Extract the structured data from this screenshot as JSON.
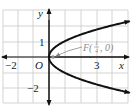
{
  "figure": {
    "equation": "y^2 = x",
    "origin_px": [
      49,
      57
    ],
    "unit_px": 15.8,
    "grid": {
      "color": "#c8c8c8",
      "x_lines_px": [
        3,
        18,
        33,
        49,
        65,
        81,
        97,
        112,
        128
      ],
      "y_lines_px": [
        10,
        26,
        42,
        57,
        73,
        88,
        103
      ]
    },
    "axes": {
      "x_label": "x",
      "y_label": "y",
      "origin_label": "O",
      "x_ticks": [
        {
          "value": -2,
          "label": "−2"
        },
        {
          "value": 3,
          "label": "3"
        }
      ],
      "y_ticks": [
        {
          "value": 1,
          "label": "1"
        },
        {
          "value": -2,
          "label": "−2"
        }
      ]
    },
    "curve": {
      "name": "parabola",
      "color": "#111111",
      "x_range": [
        0,
        5.1
      ]
    },
    "focus": {
      "label_prefix": "F(",
      "label_num": "1",
      "label_den": "4",
      "label_suffix": ", 0)",
      "x": 0.25,
      "y": 0,
      "color": "#8a8a8a"
    }
  }
}
